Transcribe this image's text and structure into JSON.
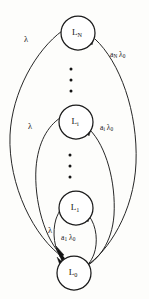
{
  "figure": {
    "background_color": "#fdfdfb",
    "ink_color": "#141414",
    "width": 149,
    "height": 299
  },
  "nodes": [
    {
      "id": "L_N",
      "base": "L",
      "sub": "N",
      "cx": 78,
      "cy": 33,
      "r": 17
    },
    {
      "id": "L_i",
      "base": "L",
      "sub": "i",
      "cx": 76,
      "cy": 122,
      "r": 17
    },
    {
      "id": "L_1",
      "base": "L",
      "sub": "1",
      "cx": 76,
      "cy": 208,
      "r": 17
    },
    {
      "id": "L_0",
      "base": "L",
      "sub": "0",
      "cx": 74,
      "cy": 273,
      "r": 17
    }
  ],
  "ellipses": [
    {
      "name": "ellipsis-upper",
      "cx": 71,
      "dots_y": [
        69,
        80,
        91
      ]
    },
    {
      "name": "ellipsis-lower",
      "cx": 70,
      "dots_y": [
        155,
        166,
        177
      ]
    }
  ],
  "edge_labels": [
    {
      "id": "lambda-N",
      "base": "λ",
      "sub": "",
      "tail": "",
      "x": 24,
      "y": 40
    },
    {
      "id": "a-N-lambda",
      "base": "a",
      "sub": "N",
      "tail": " λ",
      "tail_sub": "0",
      "x": 110,
      "y": 55
    },
    {
      "id": "lambda-i",
      "base": "λ",
      "sub": "",
      "tail": "",
      "x": 28,
      "y": 127
    },
    {
      "id": "a-i-lambda",
      "base": "a",
      "sub": "i",
      "tail": " λ",
      "tail_sub": "0",
      "x": 100,
      "y": 128
    },
    {
      "id": "lambda-1",
      "base": "λ",
      "sub": "",
      "tail": "",
      "x": 48,
      "y": 231
    },
    {
      "id": "a-1-lambda",
      "base": "a",
      "sub": "1",
      "tail": " λ",
      "tail_sub": "0",
      "x": 61,
      "y": 238
    }
  ],
  "edges": [
    {
      "id": "L0-to-LN",
      "label_ref": "lambda-N",
      "direction": "up",
      "description": "outer left arc from L_0 to L_N"
    },
    {
      "id": "LN-to-L0",
      "label_ref": "a-N-lambda",
      "direction": "down",
      "description": "outer right arc from L_N to L_0"
    },
    {
      "id": "L0-to-Li",
      "label_ref": "lambda-i",
      "direction": "up",
      "description": "middle left arc from L_0 to L_i"
    },
    {
      "id": "Li-to-L0",
      "label_ref": "a-i-lambda",
      "direction": "down",
      "description": "middle right arc from L_i to L_0"
    },
    {
      "id": "L0-to-L1",
      "label_ref": "lambda-1",
      "direction": "up",
      "description": "inner left arc from L_0 to L_1"
    },
    {
      "id": "L1-to-L0",
      "label_ref": "a-1-lambda",
      "direction": "down",
      "description": "inner right arc from L_1 to L_0"
    }
  ]
}
